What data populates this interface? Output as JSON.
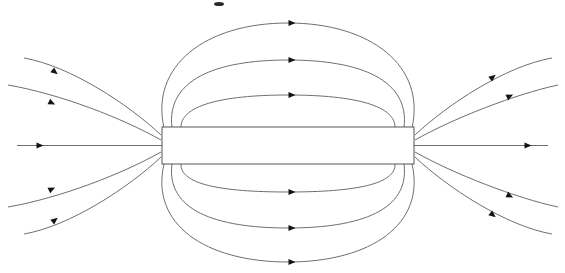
{
  "figure": {
    "background_color": "#ffffff",
    "line_color": "#6e6e6e",
    "arrow_color": "#141414",
    "magnet_stroke_color": "#555555",
    "magnet_fill_color": "#ffffff",
    "width": 565,
    "height": 273
  },
  "chart_data": {
    "type": "diagram",
    "subtitle": "",
    "xlabel": "",
    "ylabel": "",
    "grid": false,
    "legend": "none",
    "xlim": [
      0,
      565
    ],
    "ylim": [
      0,
      273
    ],
    "magnet": {
      "name": "bar-magnet",
      "shape": "rectangle",
      "x": 162,
      "y": 127,
      "width": 252,
      "height": 37,
      "center_x": 288,
      "center_y": 145.5,
      "left_pole_x": 162,
      "right_pole_x": 414
    },
    "field_line_count": 13,
    "arrow_direction": "left-to-right (N pole on right, S pole on left)",
    "series": [
      {
        "name": "axial-line",
        "group": "axis",
        "path": "M 17 145.5 L 548 145.5",
        "arrows": [
          {
            "x": 40,
            "y": 145.5,
            "angle": 0
          },
          {
            "x": 528,
            "y": 145.5,
            "angle": 0
          }
        ]
      },
      {
        "name": "top-loop-outer",
        "group": "closed-loop-above",
        "apex_y": 23,
        "path": "M 164 128 C 150 66 205 23 288 23 C 371 23 426 66 412 128",
        "arrows": [
          {
            "x": 292,
            "y": 23,
            "angle": 0
          }
        ]
      },
      {
        "name": "top-loop-middle",
        "group": "closed-loop-above",
        "apex_y": 60,
        "path": "M 172 128 C 166 80 215 60 288 60 C 361 60 410 80 404 128",
        "arrows": [
          {
            "x": 292,
            "y": 60,
            "angle": 0
          }
        ]
      },
      {
        "name": "top-loop-inner",
        "group": "closed-loop-above",
        "apex_y": 95,
        "path": "M 181 128 C 180 106 220 95 288 95 C 356 95 396 106 395 128",
        "arrows": [
          {
            "x": 292,
            "y": 95,
            "angle": 0
          }
        ]
      },
      {
        "name": "bottom-loop-inner",
        "group": "closed-loop-below",
        "apex_y": 192,
        "path": "M 181 164 C 180 184 220 192 288 192 C 356 192 396 184 395 164",
        "arrows": [
          {
            "x": 292,
            "y": 192,
            "angle": 0
          }
        ]
      },
      {
        "name": "bottom-loop-middle",
        "group": "closed-loop-below",
        "apex_y": 228,
        "path": "M 172 164 C 166 210 215 228 288 228 C 361 228 410 210 404 164",
        "arrows": [
          {
            "x": 292,
            "y": 228,
            "angle": 0
          }
        ]
      },
      {
        "name": "bottom-loop-outer",
        "group": "closed-loop-below",
        "apex_y": 262,
        "path": "M 164 164 C 150 224 205 262 288 262 C 371 262 426 224 412 164",
        "arrows": [
          {
            "x": 292,
            "y": 262,
            "angle": 0
          }
        ]
      },
      {
        "name": "left-upper-outer",
        "group": "open-left",
        "path": "M 24 58 C 70 66 128 104 161 135",
        "arrows": [
          {
            "x": 55,
            "y": 72,
            "angle": 38
          }
        ]
      },
      {
        "name": "left-upper-inner",
        "group": "open-left",
        "path": "M 8 85 C 60 94 122 118 161 140",
        "arrows": [
          {
            "x": 52,
            "y": 103,
            "angle": 26
          }
        ]
      },
      {
        "name": "left-lower-inner",
        "group": "open-left",
        "path": "M 8 207 C 60 198 122 174 161 152",
        "arrows": [
          {
            "x": 52,
            "y": 189,
            "angle": -26
          }
        ]
      },
      {
        "name": "left-lower-outer",
        "group": "open-left",
        "path": "M 24 234 C 70 226 128 188 161 157",
        "arrows": [
          {
            "x": 55,
            "y": 220,
            "angle": -38
          }
        ]
      },
      {
        "name": "right-upper-inner",
        "group": "open-right",
        "path": "M 415 140 C 454 118 516 94 558 85",
        "arrows": [
          {
            "x": 510,
            "y": 96,
            "angle": -26
          }
        ]
      },
      {
        "name": "right-upper-outer",
        "group": "open-right",
        "path": "M 415 135 C 448 104 506 66 552 58",
        "arrows": [
          {
            "x": 493,
            "y": 77,
            "angle": -38
          }
        ]
      },
      {
        "name": "right-lower-inner",
        "group": "open-right",
        "path": "M 415 152 C 454 174 516 198 558 207",
        "arrows": [
          {
            "x": 510,
            "y": 196,
            "angle": 26
          }
        ]
      },
      {
        "name": "right-lower-outer",
        "group": "open-right",
        "path": "M 415 157 C 448 188 506 226 552 234",
        "arrows": [
          {
            "x": 493,
            "y": 215,
            "angle": 38
          }
        ]
      }
    ],
    "annotations": [
      {
        "name": "top-edge-speck",
        "x": 214,
        "y": 2,
        "width": 10,
        "height": 4,
        "note": "cropped mark at top edge"
      }
    ]
  }
}
